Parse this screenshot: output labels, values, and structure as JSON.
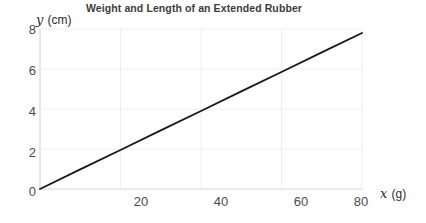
{
  "chart_data": {
    "type": "line",
    "title": "Weight and Length of an Extended Rubber",
    "xlabel": "x",
    "xunit": "(g)",
    "ylabel": "y",
    "yunit": "(cm)",
    "xlim": [
      0,
      80
    ],
    "ylim": [
      0,
      8
    ],
    "xticks": [
      0,
      20,
      40,
      60,
      80
    ],
    "yticks": [
      0,
      2,
      4,
      6,
      8
    ],
    "grid": true,
    "legend": null,
    "series": [
      {
        "name": "length vs weight",
        "x": [
          0,
          10,
          20,
          30,
          40,
          50,
          60,
          70,
          80
        ],
        "values": [
          0,
          0.98,
          1.95,
          2.93,
          3.9,
          4.88,
          5.85,
          6.83,
          7.8
        ],
        "color": "#1a1a1a",
        "slope": 0.0975,
        "intercept": 0
      }
    ],
    "tick_label_texts": {
      "x": [
        "0",
        "20",
        "40",
        "60",
        "80"
      ],
      "y": [
        "0",
        "2",
        "4",
        "6",
        "8"
      ]
    }
  },
  "colors": {
    "line": "#1a1a1a",
    "grid": "#efefef",
    "axis": "#d8d8d8",
    "title_text": "#3b3b3b",
    "tick_text": "#4a4a4a",
    "background": "#ffffff"
  }
}
